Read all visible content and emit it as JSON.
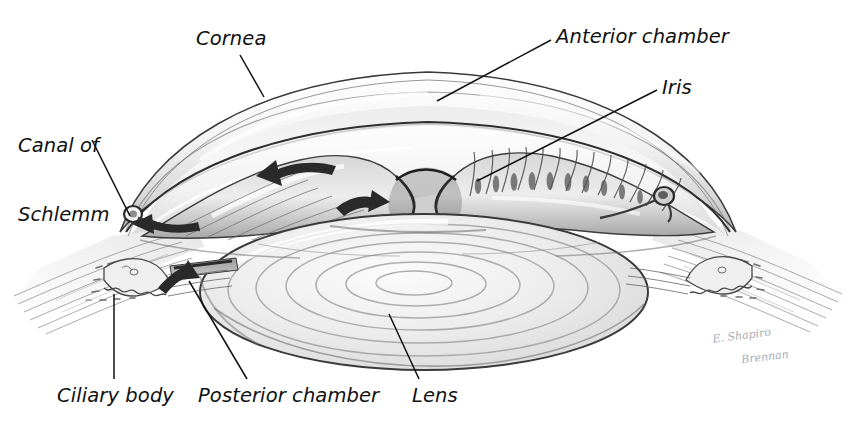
{
  "figure": {
    "background_color": "#ffffff",
    "ink_color": "#111111",
    "medium": "graphite pencil illustration"
  },
  "labels": [
    {
      "id": "cornea",
      "text": "Cornea",
      "x": 196,
      "y": 28,
      "leader": [
        [
          240,
          55
        ],
        [
          264,
          97
        ]
      ]
    },
    {
      "id": "canal-of-schlemm",
      "text": "Canal of\nSchlemm",
      "x": 18,
      "y": 88,
      "leader": [
        [
          92,
          140
        ],
        [
          130,
          216
        ]
      ]
    },
    {
      "id": "anterior-chamber",
      "text": "Anterior chamber",
      "x": 556,
      "y": 26,
      "leader": [
        [
          551,
          40
        ],
        [
          437,
          101
        ]
      ]
    },
    {
      "id": "iris",
      "text": "Iris",
      "x": 662,
      "y": 77,
      "leader": [
        [
          657,
          90
        ],
        [
          477,
          181
        ]
      ]
    },
    {
      "id": "ciliary-body",
      "text": "Ciliary body",
      "x": 57,
      "y": 385,
      "leader": [
        [
          114,
          294
        ],
        [
          114,
          379
        ]
      ]
    },
    {
      "id": "posterior-chamber",
      "text": "Posterior chamber",
      "x": 198,
      "y": 385,
      "leader": [
        [
          189,
          281
        ],
        [
          247,
          379
        ]
      ]
    },
    {
      "id": "lens",
      "text": "Lens",
      "x": 412,
      "y": 385,
      "leader": [
        [
          389,
          314
        ],
        [
          419,
          379
        ]
      ]
    }
  ],
  "signature": {
    "line1": "E. Shapiro",
    "line2": "Brennan",
    "x": 700,
    "y": 318,
    "color": "#9aa0a6"
  },
  "anatomy": {
    "structures": [
      "cornea",
      "anterior chamber",
      "iris",
      "ciliary body",
      "ciliary processes",
      "posterior chamber",
      "lens",
      "canal of Schlemm",
      "sclera",
      "trabecular meshwork",
      "zonular fibers"
    ],
    "flow_arrows": [
      {
        "id": "aqueous-flow-anterior",
        "note": "aqueous humor flowing across pupil into anterior chamber"
      },
      {
        "id": "aqueous-flow-pupil",
        "note": "aqueous humor passing through the pupil"
      },
      {
        "id": "aqueous-outflow-left",
        "note": "drainage toward canal of Schlemm (left limbus)"
      },
      {
        "id": "aqueous-secretion",
        "note": "secretion from ciliary body into posterior chamber"
      }
    ]
  }
}
